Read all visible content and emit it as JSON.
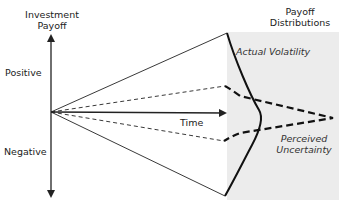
{
  "diagram": {
    "y_axis_title_line1": "Investment",
    "y_axis_title_line2": "Payoff",
    "positive_label": "Positive",
    "negative_label": "Negative",
    "time_label": "Time",
    "distributions_title_line1": "Payoff",
    "distributions_title_line2": "Distributions",
    "actual_label": "Actual Volatility",
    "perceived_label_line1": "Perceived",
    "perceived_label_line2": "Uncertainty",
    "colors": {
      "line": "#222222",
      "shade": "#ececec",
      "text": "#222222"
    }
  }
}
